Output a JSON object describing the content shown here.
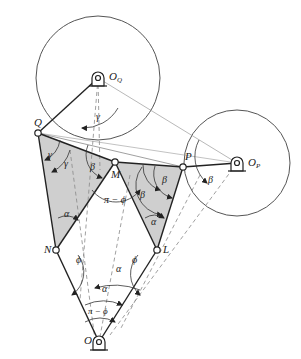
{
  "diagram": {
    "type": "linkage-mechanism",
    "colors": {
      "line": "#222222",
      "thin": "#555555",
      "dashed": "#888888",
      "shade": "#cfcfcf",
      "background": "#ffffff"
    },
    "points": {
      "O_Q": {
        "label": "O",
        "sub": "Q",
        "x": 98,
        "y": 106
      },
      "O_P": {
        "label": "O",
        "sub": "P",
        "x": 237,
        "y": 163
      },
      "Q": {
        "label": "Q",
        "x": 38,
        "y": 133
      },
      "M": {
        "label": "M",
        "x": 115,
        "y": 162
      },
      "P": {
        "label": "P",
        "x": 183,
        "y": 167
      },
      "N": {
        "label": "N",
        "x": 56,
        "y": 250
      },
      "L": {
        "label": "L",
        "x": 157,
        "y": 250
      },
      "O": {
        "label": "O",
        "x": 99,
        "y": 342
      }
    },
    "circles": [
      {
        "center": "O_Q",
        "r": 62
      },
      {
        "center": "O_P",
        "r": 53
      }
    ],
    "angle_labels": {
      "gamma_1": "γ",
      "gamma_2": "γ",
      "gamma_3": "γ",
      "beta_1": "β",
      "beta_2": "β",
      "beta_3": "β",
      "beta_4": "β",
      "beta_5": "β",
      "pi_minus_phi_top": "π − ϕ",
      "pi_minus_phi_bottom": "π − ϕ",
      "alpha_1": "α",
      "alpha_2": "α",
      "alpha_3": "α",
      "alpha_4": "α",
      "phi_left": "ϕ",
      "phi_right": "ϕ"
    }
  }
}
